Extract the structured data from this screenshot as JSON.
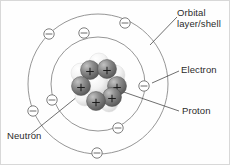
{
  "figure": {
    "background_color": "#fefefe",
    "border_color": "#d8d8d8"
  },
  "labels": {
    "orbital": {
      "line1": "Orbital",
      "line2": "layer/shell"
    },
    "electron": "Electron",
    "proton": "Proton",
    "neutron": "Neutron"
  },
  "colors": {
    "shell_stroke": "#8a8a8a",
    "leader_line": "#4a4a4a",
    "electron_fill": "#ffffff",
    "electron_stroke": "#6f6f6f",
    "proton_sphere": "#6e6e6e",
    "neutron_sphere": "#e8e8e8",
    "text": "#2b2b2b"
  },
  "atom": {
    "center": {
      "x": 97,
      "y": 83
    },
    "shells": [
      {
        "name": "inner-shell",
        "radius": 47,
        "electron_count": 4
      },
      {
        "name": "outer-shell",
        "radius": 70,
        "electron_count": 4
      }
    ],
    "electrons": [
      {
        "shell": "inner",
        "x": 83,
        "y": 32,
        "symbol": "minus"
      },
      {
        "shell": "inner",
        "x": 143,
        "y": 85,
        "symbol": "minus"
      },
      {
        "shell": "inner",
        "x": 117,
        "y": 127,
        "symbol": "minus"
      },
      {
        "shell": "inner",
        "x": 51,
        "y": 99,
        "symbol": "minus"
      },
      {
        "shell": "outer",
        "x": 48,
        "y": 33,
        "symbol": "minus"
      },
      {
        "shell": "outer",
        "x": 124,
        "y": 22,
        "symbol": "minus"
      },
      {
        "shell": "outer",
        "x": 96,
        "y": 152,
        "symbol": "minus"
      },
      {
        "shell": "outer",
        "x": 32,
        "y": 110,
        "symbol": "minus"
      }
    ],
    "nucleus": {
      "proton_count": 6,
      "neutron_count": 6,
      "proton_symbol": "+",
      "protons": [
        {
          "x": 89,
          "y": 69,
          "r": 9.5
        },
        {
          "x": 106,
          "y": 68,
          "r": 9.5
        },
        {
          "x": 80,
          "y": 85,
          "r": 9.5
        },
        {
          "x": 116,
          "y": 85,
          "r": 9.5
        },
        {
          "x": 95,
          "y": 100,
          "r": 9.5
        },
        {
          "x": 111,
          "y": 96,
          "r": 9.5
        }
      ],
      "neutrons": [
        {
          "x": 80,
          "y": 72,
          "r": 10
        },
        {
          "x": 98,
          "y": 62,
          "r": 10
        },
        {
          "x": 114,
          "y": 74,
          "r": 10
        },
        {
          "x": 96,
          "y": 83,
          "r": 11
        },
        {
          "x": 84,
          "y": 95,
          "r": 10
        },
        {
          "x": 108,
          "y": 102,
          "r": 9
        }
      ]
    }
  },
  "leaders": [
    {
      "name": "orbital-leader",
      "from_x": 149,
      "from_y": 44,
      "to_x": 176,
      "to_y": 16
    },
    {
      "name": "electron-leader",
      "from_x": 151,
      "from_y": 82,
      "to_x": 178,
      "to_y": 70
    },
    {
      "name": "proton-leader",
      "from_x": 111,
      "from_y": 87,
      "to_x": 178,
      "to_y": 110
    },
    {
      "name": "neutron-leader",
      "from_x": 92,
      "from_y": 83,
      "to_x": 30,
      "to_y": 133
    }
  ]
}
